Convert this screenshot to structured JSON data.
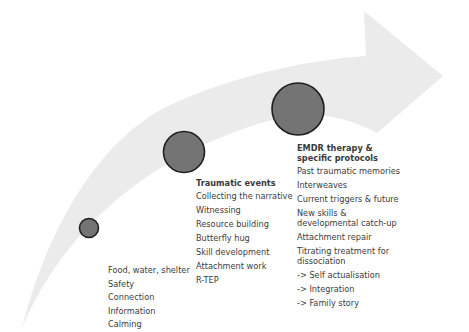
{
  "diagram": {
    "type": "progression-arrow",
    "colors": {
      "arrow_fill": "#ebebeb",
      "circle_fill": "#747474",
      "circle_stroke": "#1e1e1e",
      "text": "#3c3c3c"
    },
    "stages": [
      {
        "title": "",
        "items": [
          "Food, water, shelter",
          "Safety",
          "Connection",
          "Information",
          "Calming"
        ]
      },
      {
        "title": "Traumatic events",
        "items": [
          "Collecting the narrative",
          "Witnessing",
          "Resource building",
          "Butterfly hug",
          "Skill development",
          "Attachment work",
          "R-TEP"
        ]
      },
      {
        "title": "EMDR therapy & specific protocols",
        "items": [
          "Past traumatic memories",
          "Interweaves",
          "Current triggers & future",
          "New skills & developmental catch-up",
          "Attachment repair",
          "Titrating treatment for dissociation",
          "-> Self actualisation",
          "-> Integration",
          "-> Family story"
        ]
      }
    ]
  }
}
